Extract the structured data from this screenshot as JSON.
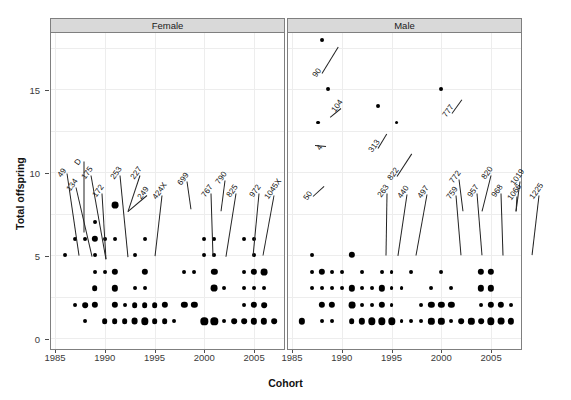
{
  "chart_data": {
    "type": "scatter",
    "title": "",
    "xlabel": "Cohort",
    "ylabel": "Total offspring",
    "xlim": [
      1984.6,
      2008.0
    ],
    "ylim": [
      -0.6,
      18.4
    ],
    "xticks": [
      1985,
      1990,
      1995,
      2000,
      2005
    ],
    "yticks": [
      0,
      5,
      10,
      15
    ],
    "grid": true,
    "legend": "none",
    "facet_variable": "Sex",
    "facets": [
      "Female",
      "Male"
    ],
    "size_encoding": "bubble area = number of individuals",
    "series": [
      {
        "name": "Female",
        "points": [
          {
            "x": 1986,
            "y": 5,
            "n": 1
          },
          {
            "x": 1987,
            "y": 6,
            "n": 1
          },
          {
            "x": 1987,
            "y": 2,
            "n": 1
          },
          {
            "x": 1988,
            "y": 6,
            "n": 1
          },
          {
            "x": 1988,
            "y": 2,
            "n": 3
          },
          {
            "x": 1988,
            "y": 1,
            "n": 1
          },
          {
            "x": 1989,
            "y": 7,
            "n": 1
          },
          {
            "x": 1989,
            "y": 6,
            "n": 4
          },
          {
            "x": 1989,
            "y": 5,
            "n": 1
          },
          {
            "x": 1989,
            "y": 4,
            "n": 1
          },
          {
            "x": 1989,
            "y": 3,
            "n": 3
          },
          {
            "x": 1989,
            "y": 2,
            "n": 4
          },
          {
            "x": 1990,
            "y": 6,
            "n": 1
          },
          {
            "x": 1990,
            "y": 4,
            "n": 1
          },
          {
            "x": 1990,
            "y": 1,
            "n": 3
          },
          {
            "x": 1991,
            "y": 8,
            "n": 5
          },
          {
            "x": 1991,
            "y": 6,
            "n": 1
          },
          {
            "x": 1991,
            "y": 4,
            "n": 4
          },
          {
            "x": 1991,
            "y": 3,
            "n": 4
          },
          {
            "x": 1991,
            "y": 2,
            "n": 4
          },
          {
            "x": 1991,
            "y": 1,
            "n": 3
          },
          {
            "x": 1992,
            "y": 2,
            "n": 1
          },
          {
            "x": 1992,
            "y": 1,
            "n": 3
          },
          {
            "x": 1993,
            "y": 5,
            "n": 1
          },
          {
            "x": 1993,
            "y": 3,
            "n": 1
          },
          {
            "x": 1993,
            "y": 2,
            "n": 3
          },
          {
            "x": 1993,
            "y": 1,
            "n": 5
          },
          {
            "x": 1994,
            "y": 6,
            "n": 1
          },
          {
            "x": 1994,
            "y": 4,
            "n": 4
          },
          {
            "x": 1994,
            "y": 3,
            "n": 1
          },
          {
            "x": 1994,
            "y": 2,
            "n": 3
          },
          {
            "x": 1994,
            "y": 1,
            "n": 6
          },
          {
            "x": 1995,
            "y": 2,
            "n": 3
          },
          {
            "x": 1995,
            "y": 1,
            "n": 3
          },
          {
            "x": 1996,
            "y": 2,
            "n": 4
          },
          {
            "x": 1996,
            "y": 1,
            "n": 3
          },
          {
            "x": 1997,
            "y": 1,
            "n": 1
          },
          {
            "x": 1998,
            "y": 4,
            "n": 1
          },
          {
            "x": 1998,
            "y": 2,
            "n": 4
          },
          {
            "x": 1999,
            "y": 4,
            "n": 1
          },
          {
            "x": 1999,
            "y": 2,
            "n": 4
          },
          {
            "x": 2000,
            "y": 6,
            "n": 1
          },
          {
            "x": 2000,
            "y": 5,
            "n": 1
          },
          {
            "x": 2000,
            "y": 1,
            "n": 6
          },
          {
            "x": 2001,
            "y": 6,
            "n": 1
          },
          {
            "x": 2001,
            "y": 5,
            "n": 1
          },
          {
            "x": 2001,
            "y": 4,
            "n": 4
          },
          {
            "x": 2001,
            "y": 3,
            "n": 5
          },
          {
            "x": 2001,
            "y": 1,
            "n": 6
          },
          {
            "x": 2002,
            "y": 3,
            "n": 1
          },
          {
            "x": 2002,
            "y": 1,
            "n": 1
          },
          {
            "x": 2003,
            "y": 1,
            "n": 3
          },
          {
            "x": 2004,
            "y": 6,
            "n": 1
          },
          {
            "x": 2004,
            "y": 4,
            "n": 1
          },
          {
            "x": 2004,
            "y": 3,
            "n": 1
          },
          {
            "x": 2004,
            "y": 2,
            "n": 1
          },
          {
            "x": 2004,
            "y": 1,
            "n": 3
          },
          {
            "x": 2005,
            "y": 6,
            "n": 1
          },
          {
            "x": 2005,
            "y": 5,
            "n": 1
          },
          {
            "x": 2005,
            "y": 4,
            "n": 4
          },
          {
            "x": 2005,
            "y": 3,
            "n": 1
          },
          {
            "x": 2005,
            "y": 2,
            "n": 4
          },
          {
            "x": 2005,
            "y": 1,
            "n": 4
          },
          {
            "x": 2006,
            "y": 4,
            "n": 5
          },
          {
            "x": 2006,
            "y": 3,
            "n": 1
          },
          {
            "x": 2006,
            "y": 2,
            "n": 3
          },
          {
            "x": 2006,
            "y": 1,
            "n": 4
          },
          {
            "x": 2007,
            "y": 1,
            "n": 3
          }
        ],
        "labeled": [
          {
            "label": "49",
            "x": 1987,
            "y": 6
          },
          {
            "label": "D",
            "x": 1988,
            "y": 7
          },
          {
            "label": "134",
            "x": 1988,
            "y": 6
          },
          {
            "label": "175",
            "x": 1989,
            "y": 6
          },
          {
            "label": "172",
            "x": 1989,
            "y": 6
          },
          {
            "label": "253",
            "x": 1991,
            "y": 8
          },
          {
            "label": "227",
            "x": 1991,
            "y": 8
          },
          {
            "label": "249",
            "x": 1991,
            "y": 6
          },
          {
            "label": "424X",
            "x": 1993,
            "y": 6
          },
          {
            "label": "699",
            "x": 1995,
            "y": 8
          },
          {
            "label": "767",
            "x": 2000,
            "y": 6
          },
          {
            "label": "790",
            "x": 2000,
            "y": 8
          },
          {
            "label": "825",
            "x": 2001,
            "y": 6
          },
          {
            "label": "972",
            "x": 2004,
            "y": 6
          },
          {
            "label": "1045X",
            "x": 2005,
            "y": 6
          }
        ]
      },
      {
        "name": "Male",
        "points": [
          {
            "x": 1986,
            "y": 1,
            "n": 4
          },
          {
            "x": 1987,
            "y": 5,
            "n": 1
          },
          {
            "x": 1987,
            "y": 4,
            "n": 1
          },
          {
            "x": 1987,
            "y": 3,
            "n": 1
          },
          {
            "x": 1987.6,
            "y": 13,
            "n": 1
          },
          {
            "x": 1988,
            "y": 18,
            "n": 1
          },
          {
            "x": 1988,
            "y": 4,
            "n": 4
          },
          {
            "x": 1988,
            "y": 3,
            "n": 1
          },
          {
            "x": 1988,
            "y": 2,
            "n": 4
          },
          {
            "x": 1988,
            "y": 1,
            "n": 1
          },
          {
            "x": 1988.6,
            "y": 15,
            "n": 1
          },
          {
            "x": 1989,
            "y": 4,
            "n": 1
          },
          {
            "x": 1989,
            "y": 3,
            "n": 1
          },
          {
            "x": 1989,
            "y": 2,
            "n": 4
          },
          {
            "x": 1989,
            "y": 1,
            "n": 1
          },
          {
            "x": 1990,
            "y": 4,
            "n": 1
          },
          {
            "x": 1990,
            "y": 3,
            "n": 1
          },
          {
            "x": 1991,
            "y": 5,
            "n": 4
          },
          {
            "x": 1991,
            "y": 3,
            "n": 4
          },
          {
            "x": 1991,
            "y": 2,
            "n": 5
          },
          {
            "x": 1991,
            "y": 1,
            "n": 3
          },
          {
            "x": 1992,
            "y": 4,
            "n": 1
          },
          {
            "x": 1992,
            "y": 3,
            "n": 1
          },
          {
            "x": 1992,
            "y": 2,
            "n": 1
          },
          {
            "x": 1992,
            "y": 1,
            "n": 4
          },
          {
            "x": 1993,
            "y": 3,
            "n": 1
          },
          {
            "x": 1993,
            "y": 2,
            "n": 1
          },
          {
            "x": 1993,
            "y": 1,
            "n": 6
          },
          {
            "x": 1993.6,
            "y": 14,
            "n": 1
          },
          {
            "x": 1994,
            "y": 4,
            "n": 1
          },
          {
            "x": 1994,
            "y": 3,
            "n": 4
          },
          {
            "x": 1994,
            "y": 2,
            "n": 4
          },
          {
            "x": 1994,
            "y": 1,
            "n": 6
          },
          {
            "x": 1995,
            "y": 4,
            "n": 1
          },
          {
            "x": 1995,
            "y": 3,
            "n": 1
          },
          {
            "x": 1995,
            "y": 2,
            "n": 1
          },
          {
            "x": 1995,
            "y": 1,
            "n": 6
          },
          {
            "x": 1995.5,
            "y": 13,
            "n": 1
          },
          {
            "x": 1996,
            "y": 3,
            "n": 1
          },
          {
            "x": 1996,
            "y": 1,
            "n": 1
          },
          {
            "x": 1997,
            "y": 4,
            "n": 1
          },
          {
            "x": 1997,
            "y": 1,
            "n": 1
          },
          {
            "x": 1998,
            "y": 2,
            "n": 1
          },
          {
            "x": 1998,
            "y": 1,
            "n": 1
          },
          {
            "x": 1999,
            "y": 3,
            "n": 1
          },
          {
            "x": 1999,
            "y": 2,
            "n": 4
          },
          {
            "x": 1999,
            "y": 1,
            "n": 4
          },
          {
            "x": 2000,
            "y": 15,
            "n": 1
          },
          {
            "x": 2000,
            "y": 4,
            "n": 1
          },
          {
            "x": 2000,
            "y": 2,
            "n": 4
          },
          {
            "x": 2000,
            "y": 1,
            "n": 4
          },
          {
            "x": 2001,
            "y": 3,
            "n": 1
          },
          {
            "x": 2001,
            "y": 2,
            "n": 4
          },
          {
            "x": 2001,
            "y": 1,
            "n": 1
          },
          {
            "x": 2002,
            "y": 1,
            "n": 3
          },
          {
            "x": 2003,
            "y": 1,
            "n": 4
          },
          {
            "x": 2004,
            "y": 4,
            "n": 4
          },
          {
            "x": 2004,
            "y": 3,
            "n": 4
          },
          {
            "x": 2004,
            "y": 2,
            "n": 1
          },
          {
            "x": 2004,
            "y": 1,
            "n": 3
          },
          {
            "x": 2005,
            "y": 4,
            "n": 4
          },
          {
            "x": 2005,
            "y": 3,
            "n": 4
          },
          {
            "x": 2005,
            "y": 2,
            "n": 4
          },
          {
            "x": 2005,
            "y": 1,
            "n": 6
          },
          {
            "x": 2006,
            "y": 2,
            "n": 4
          },
          {
            "x": 2006,
            "y": 1,
            "n": 5
          },
          {
            "x": 2007,
            "y": 1,
            "n": 4
          },
          {
            "x": 2007,
            "y": 2,
            "n": 1
          }
        ],
        "labeled": [
          {
            "label": "90",
            "x": 1988,
            "y": 18
          },
          {
            "label": "104",
            "x": 1988.6,
            "y": 15
          },
          {
            "label": "4",
            "x": 1987.6,
            "y": 13
          },
          {
            "label": "313",
            "x": 1993.6,
            "y": 14
          },
          {
            "label": "822",
            "x": 1995.5,
            "y": 13
          },
          {
            "label": "777",
            "x": 2000,
            "y": 15
          },
          {
            "label": "50",
            "x": 1987,
            "y": 9
          },
          {
            "label": "263",
            "x": 1991,
            "y": 5
          },
          {
            "label": "440",
            "x": 1993,
            "y": 4
          },
          {
            "label": "497",
            "x": 1995,
            "y": 6
          },
          {
            "label": "759",
            "x": 1999,
            "y": 6
          },
          {
            "label": "772",
            "x": 1999,
            "y": 4
          },
          {
            "label": "957",
            "x": 2001,
            "y": 7
          },
          {
            "label": "820",
            "x": 2001,
            "y": 7
          },
          {
            "label": "968",
            "x": 2003,
            "y": 4
          },
          {
            "label": "1019",
            "x": 2005,
            "y": 6
          },
          {
            "label": "1066",
            "x": 2005,
            "y": 6
          },
          {
            "label": "1225",
            "x": 2006,
            "y": 6
          }
        ]
      }
    ]
  },
  "axes": {
    "y_label": "Total offspring",
    "x_label": "Cohort",
    "y_ticks": [
      "0",
      "5",
      "10",
      "15"
    ],
    "x_ticks": [
      "1985",
      "1990",
      "1995",
      "2000",
      "2005"
    ]
  },
  "panels": [
    {
      "title": "Female"
    },
    {
      "title": "Male"
    }
  ],
  "female_labels": [
    {
      "text": "49",
      "tx": 63,
      "ty": 170,
      "px": 79,
      "py": 255
    },
    {
      "text": "D",
      "tx": 80,
      "ty": 158,
      "px": 84,
      "py": 232
    },
    {
      "text": "134",
      "tx": 72,
      "ty": 184,
      "px": 92,
      "py": 256
    },
    {
      "text": "175",
      "tx": 87,
      "ty": 172,
      "px": 106,
      "py": 259
    },
    {
      "text": "172",
      "tx": 98,
      "ty": 190,
      "px": 106,
      "py": 259
    },
    {
      "text": "253",
      "tx": 116,
      "ty": 172,
      "px": 128,
      "py": 257
    },
    {
      "text": "227",
      "tx": 136,
      "ty": 172,
      "px": 128,
      "py": 211
    },
    {
      "text": "249",
      "tx": 143,
      "ty": 192,
      "px": 128,
      "py": 211
    },
    {
      "text": "424X",
      "tx": 158,
      "ty": 192,
      "px": 155,
      "py": 256
    },
    {
      "text": "699",
      "tx": 183,
      "ty": 178,
      "px": 191,
      "py": 209
    },
    {
      "text": "767",
      "tx": 207,
      "ty": 190,
      "px": 213,
      "py": 256
    },
    {
      "text": "790",
      "tx": 221,
      "ty": 177,
      "px": 221,
      "py": 211
    },
    {
      "text": "825",
      "tx": 232,
      "ty": 190,
      "px": 226,
      "py": 256
    },
    {
      "text": "972",
      "tx": 255,
      "ty": 190,
      "px": 253,
      "py": 256
    },
    {
      "text": "1045X",
      "tx": 270,
      "ty": 192,
      "px": 263,
      "py": 255
    }
  ],
  "male_labels": [
    {
      "text": "90",
      "tx": 318,
      "ty": 70,
      "px": 338,
      "py": 47
    },
    {
      "text": "104",
      "tx": 337,
      "ty": 105,
      "px": 330,
      "py": 117
    },
    {
      "text": "4",
      "tx": 322,
      "ty": 143,
      "px": 315,
      "py": 145
    },
    {
      "text": "313",
      "tx": 374,
      "ty": 145,
      "px": 387,
      "py": 133
    },
    {
      "text": "822",
      "tx": 393,
      "ty": 173,
      "px": 412,
      "py": 153
    },
    {
      "text": "777",
      "tx": 448,
      "ty": 110,
      "px": 462,
      "py": 99
    },
    {
      "text": "50",
      "tx": 309,
      "ty": 193,
      "px": 324,
      "py": 186
    },
    {
      "text": "263",
      "tx": 383,
      "ty": 190,
      "px": 386,
      "py": 255
    },
    {
      "text": "440",
      "tx": 403,
      "ty": 191,
      "px": 398,
      "py": 255
    },
    {
      "text": "497",
      "tx": 423,
      "ty": 191,
      "px": 416,
      "py": 255
    },
    {
      "text": "759",
      "tx": 452,
      "ty": 192,
      "px": 461,
      "py": 255
    },
    {
      "text": "772",
      "tx": 455,
      "ty": 176,
      "px": 463,
      "py": 211
    },
    {
      "text": "957",
      "tx": 473,
      "ty": 190,
      "px": 482,
      "py": 255
    },
    {
      "text": "820",
      "tx": 487,
      "ty": 172,
      "px": 482,
      "py": 211
    },
    {
      "text": "968",
      "tx": 497,
      "ty": 190,
      "px": 503,
      "py": 255
    },
    {
      "text": "1019",
      "tx": 516,
      "ty": 178,
      "px": 516,
      "py": 211
    },
    {
      "text": "1066",
      "tx": 513,
      "ty": 193,
      "px": 516,
      "py": 211
    },
    {
      "text": "1225",
      "tx": 535,
      "ty": 192,
      "px": 532,
      "py": 255
    }
  ]
}
